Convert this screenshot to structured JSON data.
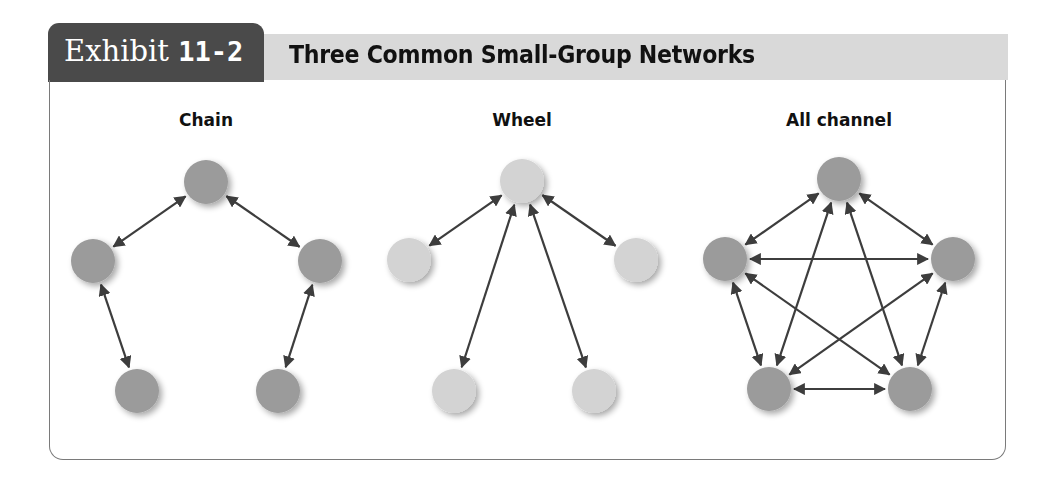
{
  "exhibit": {
    "label": "Exhibit",
    "number": "11-2",
    "title": "Three Common Small-Group Networks"
  },
  "colors": {
    "tab": "#4a4a4a",
    "title_bar": "#d9d9d9",
    "node_dark": "#9b9b9b",
    "node_light": "#d3d3d3",
    "arrow": "#3d3d3d",
    "frame": "#7a7a7a"
  },
  "networks": [
    {
      "name": "Chain",
      "node_style": "dark",
      "nodes": [
        {
          "id": "top",
          "x": 206,
          "y": 182
        },
        {
          "id": "left",
          "x": 93,
          "y": 261
        },
        {
          "id": "right",
          "x": 320,
          "y": 261
        },
        {
          "id": "bottom-left",
          "x": 137,
          "y": 391
        },
        {
          "id": "bottom-right",
          "x": 278,
          "y": 391
        }
      ],
      "edges": [
        [
          "top",
          "left"
        ],
        [
          "top",
          "right"
        ],
        [
          "left",
          "bottom-left"
        ],
        [
          "right",
          "bottom-right"
        ]
      ]
    },
    {
      "name": "Wheel",
      "node_style": "light",
      "nodes": [
        {
          "id": "top",
          "x": 522,
          "y": 181
        },
        {
          "id": "left",
          "x": 409,
          "y": 260
        },
        {
          "id": "right",
          "x": 636,
          "y": 260
        },
        {
          "id": "bottom-left",
          "x": 454,
          "y": 391
        },
        {
          "id": "bottom-right",
          "x": 594,
          "y": 391
        }
      ],
      "edges": [
        [
          "top",
          "left"
        ],
        [
          "top",
          "right"
        ],
        [
          "top",
          "bottom-left"
        ],
        [
          "top",
          "bottom-right"
        ]
      ]
    },
    {
      "name": "All channel",
      "node_style": "dark",
      "nodes": [
        {
          "id": "top",
          "x": 839,
          "y": 179
        },
        {
          "id": "left",
          "x": 725,
          "y": 259
        },
        {
          "id": "right",
          "x": 953,
          "y": 259
        },
        {
          "id": "bottom-left",
          "x": 769,
          "y": 389
        },
        {
          "id": "bottom-right",
          "x": 910,
          "y": 389
        }
      ],
      "edges": [
        [
          "top",
          "left"
        ],
        [
          "top",
          "right"
        ],
        [
          "top",
          "bottom-left"
        ],
        [
          "top",
          "bottom-right"
        ],
        [
          "left",
          "right"
        ],
        [
          "left",
          "bottom-left"
        ],
        [
          "left",
          "bottom-right"
        ],
        [
          "right",
          "bottom-left"
        ],
        [
          "right",
          "bottom-right"
        ],
        [
          "bottom-left",
          "bottom-right"
        ]
      ]
    }
  ]
}
